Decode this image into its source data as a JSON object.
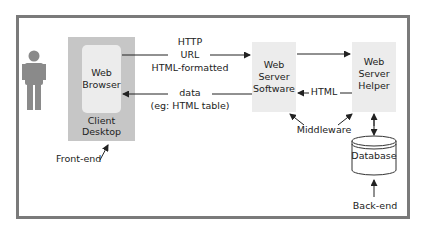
{
  "diagram": {
    "client": {
      "outer_label_line1": "Client",
      "outer_label_line2": "Desktop",
      "inner_label_line1": "Web",
      "inner_label_line2": "Browser",
      "annotation": "Front-end"
    },
    "request_arrow": {
      "line1": "HTTP",
      "line2": "URL",
      "line3": "HTML-formatted"
    },
    "response_arrow": {
      "line1": "data",
      "line2": "(eg: HTML table)"
    },
    "web_server_software": {
      "line1": "Web",
      "line2": "Server",
      "line3": "Software"
    },
    "web_server_helper": {
      "line1": "Web",
      "line2": "Server",
      "line3": "Helper"
    },
    "helper_to_server_arrow": {
      "label": "HTML"
    },
    "middleware": {
      "label": "Middleware"
    },
    "database": {
      "label": "Database",
      "annotation": "Back-end"
    },
    "colors": {
      "frame": "#7a7a7a",
      "client_box": "#c6c6c6",
      "component_box": "#ececec",
      "person": "#8a8a8a",
      "arrow": "#222222"
    }
  }
}
